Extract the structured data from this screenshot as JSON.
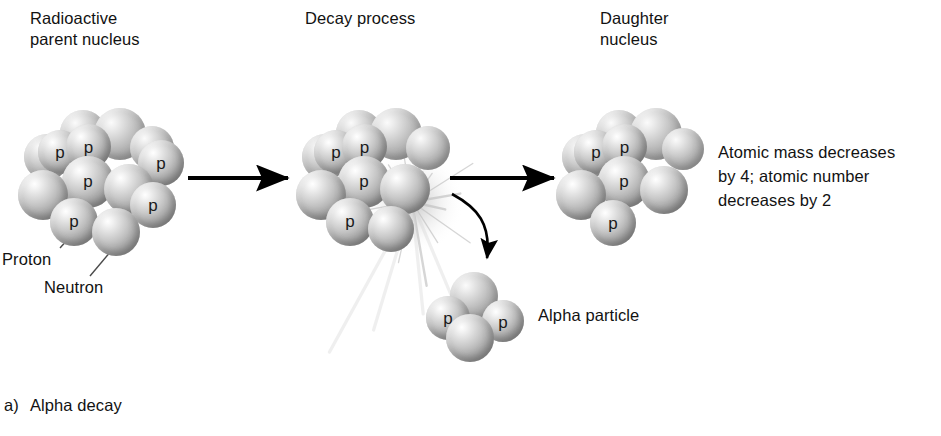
{
  "figure": {
    "caption_index": "a)",
    "caption_text": "Alpha decay",
    "headers": {
      "parent": "Radioactive\nparent nucleus",
      "process": "Decay process",
      "daughter": "Daughter\nnucleus"
    },
    "note": "Atomic mass decreases\nby 4;  atomic number\ndecreases by 2",
    "labels": {
      "proton": "Proton",
      "neutron": "Neutron",
      "alpha": "Alpha particle"
    },
    "nucleon_symbol": "p",
    "colors": {
      "background": "#ffffff",
      "text": "#121212",
      "arrow": "#000000",
      "sphere_highlight": "#ffffff",
      "sphere_shadow": "#8a8a8a",
      "leader_line": "#4a4a4a"
    },
    "counts": {
      "parent_spheres": 13,
      "parent_protons": 6,
      "process_spheres": 11,
      "process_protons": 4,
      "daughter_spheres": 10,
      "daughter_protons": 4,
      "alpha_spheres": 4,
      "alpha_protons": 2
    }
  },
  "clusters": {
    "parent": {
      "origin": [
        18,
        108
      ],
      "spheres": [
        {
          "x": 42,
          "y": 2,
          "d": 46,
          "layer": "back",
          "p": null
        },
        {
          "x": 76,
          "y": 0,
          "d": 52,
          "layer": "back",
          "p": null
        },
        {
          "x": 112,
          "y": 18,
          "d": 44,
          "layer": "back",
          "p": null
        },
        {
          "x": 6,
          "y": 26,
          "d": 46,
          "layer": "back",
          "p": null
        },
        {
          "x": 20,
          "y": 22,
          "d": 44,
          "layer": "front",
          "p": "p"
        },
        {
          "x": 48,
          "y": 16,
          "d": 45,
          "layer": "front",
          "p": "p"
        },
        {
          "x": 120,
          "y": 32,
          "d": 46,
          "layer": "front",
          "p": "p"
        },
        {
          "x": 0,
          "y": 62,
          "d": 50,
          "layer": "front",
          "p": null
        },
        {
          "x": 44,
          "y": 48,
          "d": 52,
          "layer": "front",
          "p": "p"
        },
        {
          "x": 86,
          "y": 56,
          "d": 50,
          "layer": "front",
          "p": null
        },
        {
          "x": 112,
          "y": 74,
          "d": 46,
          "layer": "front",
          "p": "p"
        },
        {
          "x": 32,
          "y": 90,
          "d": 48,
          "layer": "front",
          "p": "p"
        },
        {
          "x": 74,
          "y": 100,
          "d": 48,
          "layer": "front",
          "p": null
        }
      ]
    },
    "process": {
      "origin": [
        296,
        108
      ],
      "spheres": [
        {
          "x": 40,
          "y": 2,
          "d": 46,
          "layer": "back",
          "p": null
        },
        {
          "x": 74,
          "y": 0,
          "d": 52,
          "layer": "back",
          "p": null
        },
        {
          "x": 110,
          "y": 18,
          "d": 44,
          "layer": "back",
          "p": null
        },
        {
          "x": 6,
          "y": 26,
          "d": 46,
          "layer": "back",
          "p": null
        },
        {
          "x": 18,
          "y": 22,
          "d": 44,
          "layer": "front",
          "p": "p"
        },
        {
          "x": 46,
          "y": 16,
          "d": 45,
          "layer": "front",
          "p": "p"
        },
        {
          "x": 0,
          "y": 62,
          "d": 50,
          "layer": "front",
          "p": null
        },
        {
          "x": 42,
          "y": 48,
          "d": 52,
          "layer": "front",
          "p": "p"
        },
        {
          "x": 84,
          "y": 56,
          "d": 50,
          "layer": "front",
          "p": null
        },
        {
          "x": 30,
          "y": 90,
          "d": 48,
          "layer": "front",
          "p": "p"
        },
        {
          "x": 72,
          "y": 98,
          "d": 46,
          "layer": "front",
          "p": null
        }
      ]
    },
    "daughter": {
      "origin": [
        556,
        108
      ],
      "spheres": [
        {
          "x": 40,
          "y": 2,
          "d": 46,
          "layer": "back",
          "p": null
        },
        {
          "x": 74,
          "y": 0,
          "d": 52,
          "layer": "back",
          "p": null
        },
        {
          "x": 106,
          "y": 20,
          "d": 42,
          "layer": "back",
          "p": null
        },
        {
          "x": 6,
          "y": 26,
          "d": 46,
          "layer": "back",
          "p": null
        },
        {
          "x": 18,
          "y": 22,
          "d": 44,
          "layer": "front",
          "p": "p"
        },
        {
          "x": 46,
          "y": 16,
          "d": 45,
          "layer": "front",
          "p": "p"
        },
        {
          "x": 0,
          "y": 62,
          "d": 50,
          "layer": "front",
          "p": null
        },
        {
          "x": 42,
          "y": 48,
          "d": 52,
          "layer": "front",
          "p": "p"
        },
        {
          "x": 84,
          "y": 58,
          "d": 48,
          "layer": "front",
          "p": null
        },
        {
          "x": 34,
          "y": 92,
          "d": 46,
          "layer": "front",
          "p": "p"
        }
      ]
    },
    "alpha": {
      "origin": [
        424,
        272
      ],
      "spheres": [
        {
          "x": 26,
          "y": 0,
          "d": 48,
          "layer": "back",
          "p": null
        },
        {
          "x": 2,
          "y": 24,
          "d": 44,
          "layer": "front",
          "p": "p"
        },
        {
          "x": 58,
          "y": 28,
          "d": 42,
          "layer": "front",
          "p": "p"
        },
        {
          "x": 22,
          "y": 42,
          "d": 48,
          "layer": "front",
          "p": null
        }
      ]
    }
  },
  "arrows": {
    "parent_to_process": {
      "x1": 188,
      "y1": 178,
      "x2": 288,
      "y2": 178
    },
    "process_to_daughter": {
      "x1": 450,
      "y1": 178,
      "x2": 554,
      "y2": 178
    },
    "emission": {
      "x1": 452,
      "y1": 194,
      "x2": 487,
      "y2": 258
    }
  },
  "leaders": {
    "proton": {
      "x1": 60,
      "y1": 248,
      "x2": 86,
      "y2": 219
    },
    "neutron": {
      "x1": 90,
      "y1": 276,
      "x2": 122,
      "y2": 238
    }
  },
  "burst": {
    "cx": 412,
    "cy": 202,
    "rays": 16
  }
}
